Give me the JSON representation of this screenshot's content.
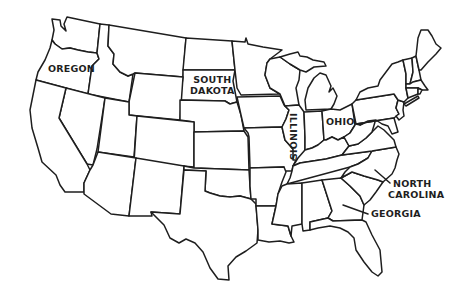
{
  "map": {
    "type": "outline map",
    "region": "United States (contiguous 48 states)",
    "line_color": "#1e1e1e",
    "background_color": "#ffffff",
    "labels": {
      "oregon": "OREGON",
      "south_dakota_line1": "SOUTH",
      "south_dakota_line2": "DAKOTA",
      "illinois": "ILLINOIS",
      "ohio": "OHIO",
      "north_carolina_line1": "NORTH",
      "north_carolina_line2": "CAROLINA",
      "georgia": "GEORGIA"
    },
    "labeled_states": [
      "Oregon",
      "South Dakota",
      "Illinois",
      "Ohio",
      "North Carolina",
      "Georgia"
    ]
  }
}
